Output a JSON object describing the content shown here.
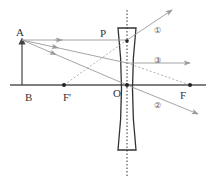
{
  "diagram": {
    "type": "concave-lens-ray-diagram",
    "labels": {
      "object_tip": "A",
      "object_base": "B",
      "front_focus": "F'",
      "optical_center": "O",
      "back_focus": "F",
      "lens_point": "P"
    },
    "rays": [
      {
        "id": "1",
        "label": "①"
      },
      {
        "id": "2",
        "label": "②"
      },
      {
        "id": "3",
        "label": "③"
      }
    ],
    "colors": {
      "axis": "#555555",
      "lens": "#333333",
      "ray": "#9a9a9a",
      "text": "#333333"
    }
  }
}
